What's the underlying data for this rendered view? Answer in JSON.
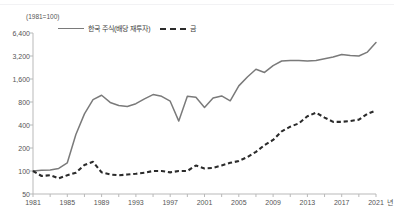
{
  "chart_data": {
    "type": "line",
    "title": "",
    "unit_note": "(1981=100)",
    "xlabel": "년",
    "ylabel": "",
    "yscale": "log2",
    "ylim": [
      50,
      6400
    ],
    "yticks": [
      50,
      100,
      200,
      400,
      800,
      1600,
      3200,
      6400
    ],
    "ytick_labels": [
      "50",
      "100",
      "200",
      "400",
      "800",
      "1,600",
      "3,200",
      "6,400"
    ],
    "xlim": [
      1981,
      2021
    ],
    "xticks": [
      1981,
      1985,
      1989,
      1993,
      1997,
      2001,
      2005,
      2009,
      2013,
      2017,
      2021
    ],
    "xtick_labels": [
      "1981",
      "1985",
      "1989",
      "1993",
      "1997",
      "2001",
      "2005",
      "2009",
      "2013",
      "2017",
      "2021"
    ],
    "grid": false,
    "legend_position": "top-left",
    "x": [
      1981,
      1982,
      1983,
      1984,
      1985,
      1986,
      1987,
      1988,
      1989,
      1990,
      1991,
      1992,
      1993,
      1994,
      1995,
      1996,
      1997,
      1998,
      1999,
      2000,
      2001,
      2002,
      2003,
      2004,
      2005,
      2006,
      2007,
      2008,
      2009,
      2010,
      2011,
      2012,
      2013,
      2014,
      2015,
      2016,
      2017,
      2018,
      2019,
      2020,
      2021
    ],
    "series": [
      {
        "name": "한국 주식(배당 재투자)",
        "style": "solid",
        "color": "#7a7a7a",
        "values": [
          100,
          102,
          103,
          108,
          128,
          300,
          560,
          860,
          980,
          790,
          720,
          700,
          760,
          880,
          1000,
          950,
          820,
          450,
          950,
          920,
          680,
          900,
          960,
          830,
          1300,
          1700,
          2150,
          1950,
          2400,
          2750,
          2800,
          2800,
          2750,
          2800,
          2950,
          3100,
          3350,
          3250,
          3200,
          3600,
          4800
        ]
      },
      {
        "name": "금",
        "style": "dashed",
        "color": "#2b2b2b",
        "values": [
          100,
          86,
          88,
          80,
          88,
          95,
          120,
          132,
          96,
          90,
          88,
          90,
          92,
          95,
          100,
          100,
          96,
          100,
          100,
          118,
          108,
          110,
          118,
          128,
          135,
          152,
          178,
          218,
          255,
          330,
          380,
          420,
          520,
          580,
          500,
          440,
          440,
          450,
          470,
          560,
          620
        ]
      }
    ]
  },
  "legend": {
    "items": [
      {
        "label": "한국 주식(배당 재투자)",
        "style": "solid"
      },
      {
        "label": "금",
        "style": "dashed"
      }
    ]
  }
}
